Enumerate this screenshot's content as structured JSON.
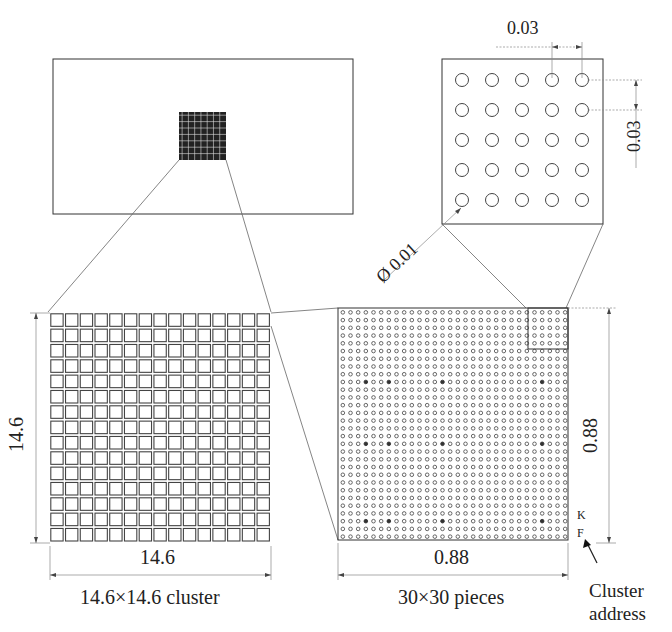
{
  "wafer": {
    "label": "substrate-outline",
    "chip_grid": 15
  },
  "hole_detail": {
    "rows": 5,
    "cols": 5,
    "pitch_x_label": "0.03",
    "pitch_y_label": "0.03",
    "diameter_label": "Ø 0.01"
  },
  "cluster_view": {
    "rows": 15,
    "cols": 15,
    "width_label": "14.6",
    "height_label": "14.6",
    "caption": "14.6×14.6 cluster"
  },
  "pieces_view": {
    "rows": 30,
    "cols": 30,
    "width_label": "0.88",
    "height_label": "0.88",
    "caption": "30×30 pieces",
    "address_letters": [
      "K",
      "F"
    ],
    "address_caption_line1": "Cluster",
    "address_caption_line2": "address",
    "dark_rows": [
      9,
      17,
      27
    ],
    "dark_cols": [
      3,
      6,
      13,
      26
    ]
  },
  "colors": {
    "line": "#333333",
    "dimension": "#888888",
    "background": "#ffffff"
  }
}
